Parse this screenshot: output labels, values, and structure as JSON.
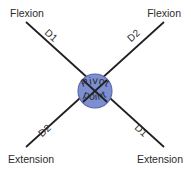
{
  "diagram": {
    "background_color": "#ffffff",
    "line_color": "#1f1f1f",
    "text_color": "#2b2b2b",
    "pivot": {
      "fill_color": "#7d8fd1",
      "stroke_color": "#5566a8",
      "center_x": 95,
      "center_y": 91,
      "radius": 17,
      "label_top": "Pivot",
      "label_bottom": "point"
    },
    "corners": {
      "top_left": "Flexion",
      "top_right": "Flexion",
      "bottom_left": "Extension",
      "bottom_right": "Extension"
    },
    "diagonal_labels": {
      "top_left": "D1",
      "top_right": "D2",
      "bottom_left": "D2",
      "bottom_right": "D1"
    }
  }
}
